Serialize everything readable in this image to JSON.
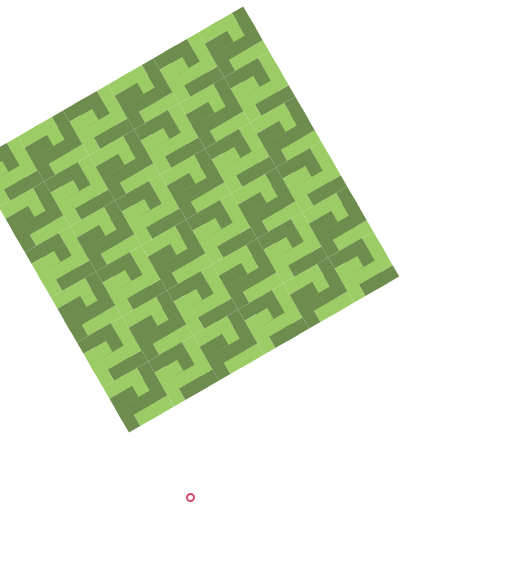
{
  "image": {
    "description": "Interlocking Greek-key / fret tessellation in two greens, rotated diagonally on white",
    "colors": {
      "background": "#ffffff",
      "light_green": "#9ccc65",
      "dark_green": "#6e8c4e",
      "marker": "#d04a6a"
    },
    "pattern": {
      "rotation_deg": -30,
      "tile_size": 52,
      "grid_cols": 6,
      "grid_rows": 6,
      "origin_x": 38,
      "origin_y": 275
    },
    "marker": {
      "shape": "ring",
      "x": 190,
      "y": 497
    }
  }
}
